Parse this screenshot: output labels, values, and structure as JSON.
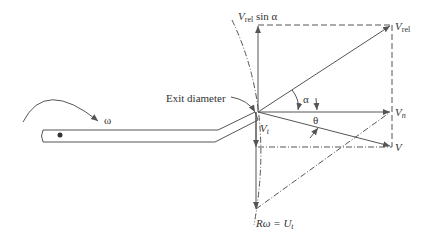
{
  "diagram": {
    "labels": {
      "vrel_sin_alpha_v": "V",
      "vrel_sin_alpha_sub": "rel",
      "vrel_sin_alpha_rest": " sin α",
      "vrel_v": "V",
      "vrel_sub": "rel",
      "exit_diameter": "Exit diameter",
      "omega": "ω",
      "alpha": "α",
      "theta": "θ",
      "vn_v": "V",
      "vn_sub": "n",
      "vt_v": "V",
      "vt_sub": "t",
      "v": "V",
      "r_omega": "Rω = U",
      "r_omega_sub": "t"
    },
    "colors": {
      "line": "#555555",
      "text": "#333333"
    }
  }
}
